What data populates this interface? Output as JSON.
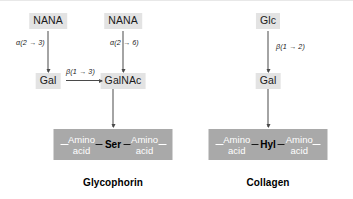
{
  "figure": {
    "background_color": "#ffffff",
    "sugar_chip_color": "#e3e3e3",
    "peptide_bar_color": "#a9a9a9",
    "arrow_color": "#4a4a4a"
  },
  "panels": [
    {
      "id": "glycophorin",
      "caption": "Glycophorin",
      "sugars": {
        "nana_left": "NANA",
        "nana_right": "NANA",
        "gal": "Gal",
        "galnac": "GalNAc"
      },
      "linkages": {
        "nana_left_to_gal": "α(2 → 3)",
        "nana_right_to_galnac": "α(2 → 6)",
        "gal_to_galnac": "β(1 → 3)"
      },
      "peptide": {
        "left_residue_line1": "Amino",
        "left_residue_line2": "acid",
        "attachment_residue": "Ser",
        "right_residue_line1": "Amino",
        "right_residue_line2": "acid"
      }
    },
    {
      "id": "collagen",
      "caption": "Collagen",
      "sugars": {
        "glc": "Glc",
        "gal": "Gal"
      },
      "linkages": {
        "glc_to_gal": "β(1 → 2)"
      },
      "peptide": {
        "left_residue_line1": "Amino",
        "left_residue_line2": "acid",
        "attachment_residue": "Hyl",
        "right_residue_line1": "Amino",
        "right_residue_line2": "acid"
      }
    }
  ]
}
